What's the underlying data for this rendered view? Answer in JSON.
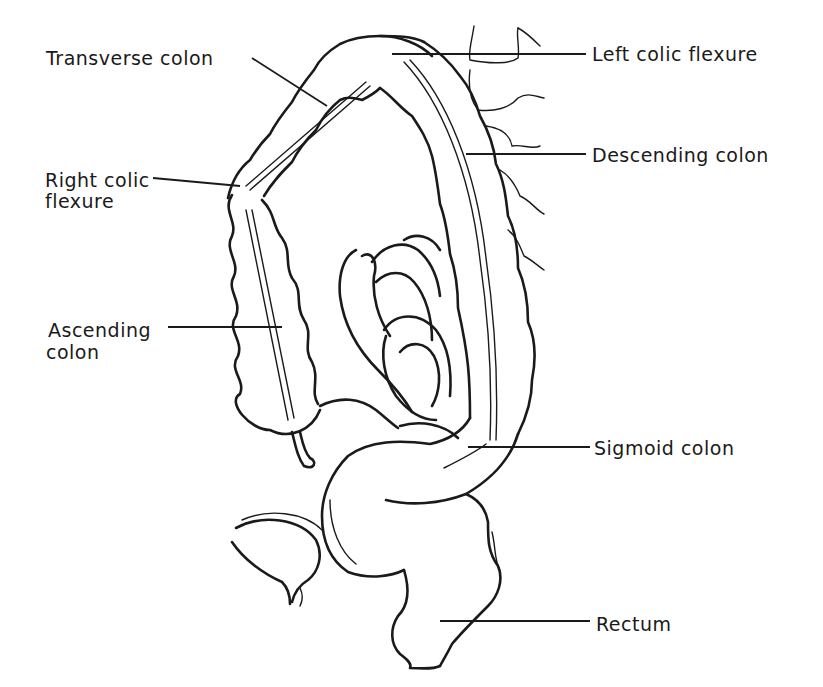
{
  "diagram": {
    "colors": {
      "ink": "#1a1a1a",
      "background": "#ffffff"
    },
    "labels": [
      {
        "id": "transverse-colon",
        "text": "Transverse colon"
      },
      {
        "id": "left-colic-flexure",
        "text": "Left colic flexure"
      },
      {
        "id": "right-colic-flexure",
        "line1": "Right colic",
        "line2": "flexure"
      },
      {
        "id": "descending-colon",
        "text": "Descending colon"
      },
      {
        "id": "ascending-colon",
        "line1": "Ascending",
        "line2": "colon"
      },
      {
        "id": "sigmoid-colon",
        "text": "Sigmoid colon"
      },
      {
        "id": "rectum",
        "text": "Rectum"
      }
    ]
  }
}
